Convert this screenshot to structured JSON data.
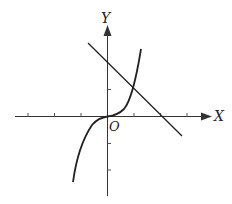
{
  "diagram": {
    "type": "coordinate-graph",
    "axes": {
      "x_label": "X",
      "y_label": "Y",
      "origin_label": "O"
    },
    "curves": [
      {
        "name": "cubic",
        "equation": "y = x^3",
        "x_range": [
          -1.3,
          1.3
        ]
      },
      {
        "name": "line",
        "equation": "y = -x + 2",
        "x_range": [
          -0.7,
          2.8
        ]
      }
    ],
    "intersection": {
      "x": 1,
      "y": 1
    },
    "x_ticks": [
      -3,
      -2,
      -1,
      1,
      2,
      3
    ],
    "y_ticks": [
      -3,
      -2,
      -1,
      1,
      2
    ],
    "colors": {
      "stroke": "#222222",
      "background": "#ffffff"
    }
  }
}
